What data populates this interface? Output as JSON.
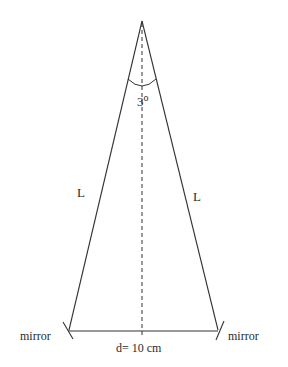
{
  "diagram": {
    "type": "isosceles-triangle-mirrors",
    "apex_angle_label": "3",
    "apex_angle_unit": "o",
    "side_left_label": "L",
    "side_right_label": "L",
    "left_mirror_label": "mirror",
    "right_mirror_label": "mirror",
    "base_label": "d= 10 cm",
    "colors": {
      "line": "#333333",
      "background": "#ffffff"
    }
  }
}
